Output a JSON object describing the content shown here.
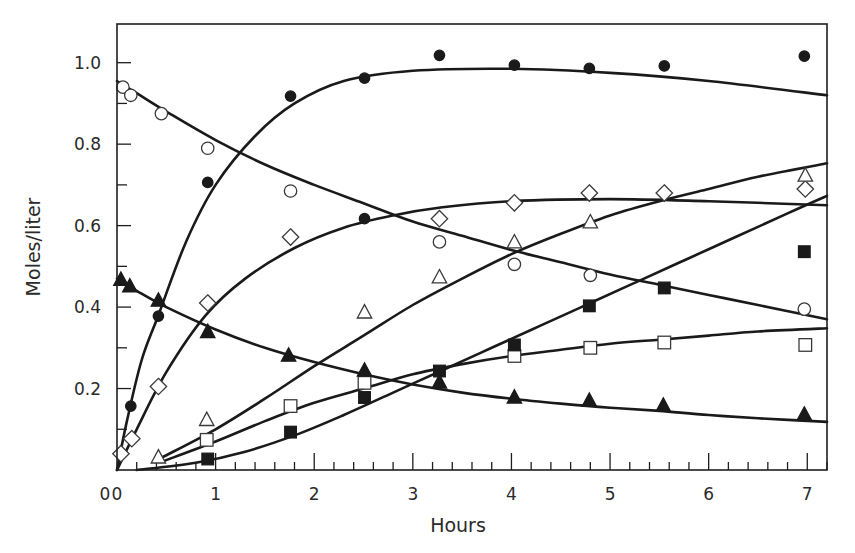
{
  "chart_data": {
    "type": "scatter",
    "title": "",
    "xlabel": "Hours",
    "ylabel": "Moles/liter",
    "xlim": [
      0,
      7.2
    ],
    "ylim": [
      0,
      1.095
    ],
    "grid": false,
    "legend": "none",
    "x_ticks": {
      "major": [
        0,
        1,
        2,
        3,
        4,
        5,
        6,
        7
      ],
      "minor_step": 0.2
    },
    "x_tick_labels": [
      "0",
      "1",
      "2",
      "3",
      "4",
      "5",
      "6",
      "7"
    ],
    "y_ticks": {
      "major": [
        0.2,
        0.4,
        0.6,
        0.8,
        1.0
      ],
      "minor_step": 0.1
    },
    "y_tick_labels": [
      "0.2",
      "0.4",
      "0.6",
      "0.8",
      "1.0"
    ],
    "series": [
      {
        "name": "filled-circle",
        "marker": "circle",
        "filled": true,
        "points": [
          [
            0.14,
            0.157
          ],
          [
            0.42,
            0.378
          ],
          [
            0.92,
            0.706
          ],
          [
            1.76,
            0.918
          ],
          [
            2.51,
            0.962
          ],
          [
            2.51,
            0.617
          ],
          [
            3.27,
            1.018
          ],
          [
            4.03,
            0.994
          ],
          [
            4.79,
            0.986
          ],
          [
            5.55,
            0.992
          ],
          [
            6.97,
            1.016
          ]
        ],
        "curve": [
          [
            0.0,
            0.0
          ],
          [
            0.1,
            0.12
          ],
          [
            0.25,
            0.27
          ],
          [
            0.42,
            0.38
          ],
          [
            0.7,
            0.56
          ],
          [
            1.0,
            0.7
          ],
          [
            1.4,
            0.82
          ],
          [
            1.8,
            0.9
          ],
          [
            2.3,
            0.955
          ],
          [
            3.0,
            0.98
          ],
          [
            4.0,
            0.985
          ],
          [
            5.0,
            0.975
          ],
          [
            6.0,
            0.955
          ],
          [
            7.2,
            0.92
          ]
        ]
      },
      {
        "name": "open-circle",
        "marker": "circle",
        "filled": false,
        "points": [
          [
            0.06,
            0.94
          ],
          [
            0.14,
            0.92
          ],
          [
            0.45,
            0.875
          ],
          [
            0.92,
            0.79
          ],
          [
            1.76,
            0.685
          ],
          [
            3.27,
            0.56
          ],
          [
            4.03,
            0.505
          ],
          [
            4.8,
            0.478
          ],
          [
            6.97,
            0.395
          ]
        ],
        "curve": [
          [
            0.0,
            0.955
          ],
          [
            0.2,
            0.925
          ],
          [
            0.5,
            0.88
          ],
          [
            1.0,
            0.81
          ],
          [
            1.5,
            0.75
          ],
          [
            2.0,
            0.7
          ],
          [
            2.5,
            0.655
          ],
          [
            3.0,
            0.61
          ],
          [
            3.5,
            0.575
          ],
          [
            4.0,
            0.54
          ],
          [
            4.5,
            0.51
          ],
          [
            5.0,
            0.48
          ],
          [
            5.5,
            0.455
          ],
          [
            6.0,
            0.43
          ],
          [
            6.5,
            0.405
          ],
          [
            7.2,
            0.37
          ]
        ]
      },
      {
        "name": "open-diamond",
        "marker": "diamond",
        "filled": false,
        "points": [
          [
            0.04,
            0.04
          ],
          [
            0.15,
            0.077
          ],
          [
            0.42,
            0.205
          ],
          [
            0.92,
            0.41
          ],
          [
            1.76,
            0.572
          ],
          [
            3.27,
            0.617
          ],
          [
            4.03,
            0.656
          ],
          [
            4.79,
            0.68
          ],
          [
            5.55,
            0.68
          ],
          [
            6.98,
            0.69
          ]
        ],
        "curve": [
          [
            0.0,
            0.0
          ],
          [
            0.2,
            0.1
          ],
          [
            0.5,
            0.24
          ],
          [
            0.9,
            0.38
          ],
          [
            1.3,
            0.47
          ],
          [
            1.8,
            0.545
          ],
          [
            2.3,
            0.595
          ],
          [
            2.8,
            0.625
          ],
          [
            3.3,
            0.645
          ],
          [
            4.0,
            0.66
          ],
          [
            5.0,
            0.665
          ],
          [
            6.0,
            0.66
          ],
          [
            7.2,
            0.65
          ]
        ]
      },
      {
        "name": "open-triangle",
        "marker": "triangle",
        "filled": false,
        "points": [
          [
            0.42,
            0.03
          ],
          [
            0.91,
            0.122
          ],
          [
            2.51,
            0.386
          ],
          [
            3.27,
            0.472
          ],
          [
            4.03,
            0.558
          ],
          [
            4.8,
            0.607
          ],
          [
            6.98,
            0.722
          ]
        ],
        "curve": [
          [
            0.45,
            0.03
          ],
          [
            1.0,
            0.1
          ],
          [
            1.5,
            0.175
          ],
          [
            2.0,
            0.255
          ],
          [
            2.5,
            0.33
          ],
          [
            3.0,
            0.405
          ],
          [
            3.5,
            0.47
          ],
          [
            4.0,
            0.53
          ],
          [
            4.5,
            0.58
          ],
          [
            5.0,
            0.625
          ],
          [
            5.5,
            0.66
          ],
          [
            6.0,
            0.69
          ],
          [
            6.5,
            0.72
          ],
          [
            7.2,
            0.753
          ]
        ]
      },
      {
        "name": "open-square",
        "marker": "square",
        "filled": false,
        "points": [
          [
            0.91,
            0.074
          ],
          [
            1.76,
            0.157
          ],
          [
            2.51,
            0.214
          ],
          [
            4.03,
            0.28
          ],
          [
            4.8,
            0.3
          ],
          [
            5.55,
            0.313
          ],
          [
            6.98,
            0.307
          ]
        ],
        "curve": [
          [
            0.45,
            0.02
          ],
          [
            1.0,
            0.07
          ],
          [
            1.5,
            0.12
          ],
          [
            2.0,
            0.165
          ],
          [
            2.5,
            0.2
          ],
          [
            3.0,
            0.235
          ],
          [
            3.5,
            0.26
          ],
          [
            4.0,
            0.28
          ],
          [
            4.5,
            0.295
          ],
          [
            5.0,
            0.31
          ],
          [
            5.5,
            0.32
          ],
          [
            6.0,
            0.33
          ],
          [
            6.5,
            0.34
          ],
          [
            7.2,
            0.348
          ]
        ]
      },
      {
        "name": "filled-square",
        "marker": "square",
        "filled": true,
        "points": [
          [
            0.92,
            0.027
          ],
          [
            1.76,
            0.093
          ],
          [
            2.51,
            0.178
          ],
          [
            3.27,
            0.243
          ],
          [
            4.03,
            0.307
          ],
          [
            4.79,
            0.403
          ],
          [
            5.55,
            0.447
          ],
          [
            6.97,
            0.536
          ]
        ],
        "curve": [
          [
            0.2,
            0.0
          ],
          [
            0.8,
            0.018
          ],
          [
            1.3,
            0.045
          ],
          [
            1.8,
            0.085
          ],
          [
            2.3,
            0.135
          ],
          [
            2.8,
            0.19
          ],
          [
            3.3,
            0.245
          ],
          [
            3.8,
            0.3
          ],
          [
            4.3,
            0.355
          ],
          [
            4.8,
            0.41
          ],
          [
            5.3,
            0.465
          ],
          [
            5.8,
            0.52
          ],
          [
            6.3,
            0.575
          ],
          [
            6.8,
            0.63
          ],
          [
            7.2,
            0.673
          ]
        ]
      },
      {
        "name": "filled-triangle",
        "marker": "triangle",
        "filled": true,
        "points": [
          [
            0.04,
            0.466
          ],
          [
            0.13,
            0.45
          ],
          [
            0.42,
            0.415
          ],
          [
            0.92,
            0.338
          ],
          [
            1.74,
            0.28
          ],
          [
            2.51,
            0.243
          ],
          [
            3.27,
            0.214
          ],
          [
            4.03,
            0.177
          ],
          [
            4.79,
            0.169
          ],
          [
            5.54,
            0.157
          ],
          [
            6.97,
            0.135
          ]
        ],
        "curve": [
          [
            0.0,
            0.47
          ],
          [
            0.2,
            0.44
          ],
          [
            0.5,
            0.4
          ],
          [
            1.0,
            0.345
          ],
          [
            1.5,
            0.3
          ],
          [
            2.0,
            0.265
          ],
          [
            2.5,
            0.235
          ],
          [
            3.0,
            0.21
          ],
          [
            3.5,
            0.19
          ],
          [
            4.0,
            0.175
          ],
          [
            4.5,
            0.163
          ],
          [
            5.0,
            0.153
          ],
          [
            5.5,
            0.145
          ],
          [
            6.0,
            0.135
          ],
          [
            6.5,
            0.127
          ],
          [
            7.2,
            0.118
          ]
        ]
      }
    ]
  },
  "labels": {
    "xlabel": "Hours",
    "ylabel": "Moles/liter",
    "origin": "0"
  }
}
